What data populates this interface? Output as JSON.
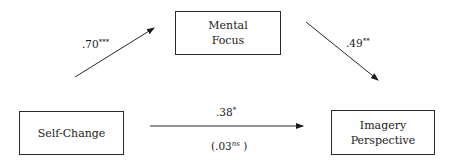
{
  "diagram": {
    "type": "mediation-path-diagram",
    "nodes": [
      {
        "id": "mental_focus",
        "lines": [
          "Mental",
          "Focus"
        ]
      },
      {
        "id": "self_change",
        "lines": [
          "Self-Change"
        ]
      },
      {
        "id": "imagery_perspective",
        "lines": [
          "Imagery",
          "Perspective"
        ]
      }
    ],
    "edges": [
      {
        "from": "self_change",
        "to": "mental_focus",
        "coef": ".70",
        "sig": "***"
      },
      {
        "from": "mental_focus",
        "to": "imagery_perspective",
        "coef": ".49",
        "sig": "**"
      },
      {
        "from": "self_change",
        "to": "imagery_perspective",
        "coef": ".38",
        "sig": "*",
        "indirect_coef": "(.03",
        "indirect_sig": "ns",
        "indirect_close": " )"
      }
    ],
    "colors": {
      "line": "#2a2a2a",
      "text": "#1a1a1a",
      "background": "#ffffff"
    }
  }
}
